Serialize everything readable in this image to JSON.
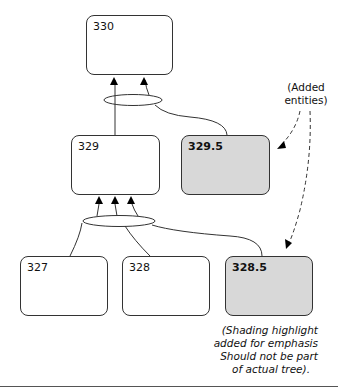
{
  "nodes": [
    {
      "id": "330",
      "label": "330",
      "shaded": false
    },
    {
      "id": "329",
      "label": "329",
      "shaded": false
    },
    {
      "id": "329.5",
      "label": "329.5",
      "shaded": true
    },
    {
      "id": "327",
      "label": "327",
      "shaded": false
    },
    {
      "id": "328",
      "label": "328",
      "shaded": false
    },
    {
      "id": "328.5",
      "label": "328.5",
      "shaded": true
    }
  ],
  "edges": [
    {
      "from": "329",
      "to": "330"
    },
    {
      "from": "329.5",
      "to": "330"
    },
    {
      "from": "327",
      "to": "329"
    },
    {
      "from": "328",
      "to": "329"
    },
    {
      "from": "328.5",
      "to": "329"
    }
  ],
  "annotations": {
    "added_entities": [
      "(Added",
      "entities)"
    ],
    "shading_note": [
      "(Shading highlight",
      "added for emphasis",
      "Should not be part",
      "of actual tree)."
    ]
  },
  "colors": {
    "shaded_fill": "#d8d8d8",
    "border": "#333333"
  }
}
